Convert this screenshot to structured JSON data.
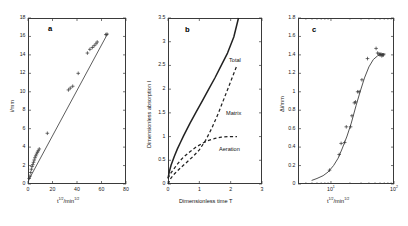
{
  "figure": {
    "panels": [
      {
        "letter": "a",
        "xlabel_html": "t<sup>1/2</sup>/min<sup>1/2</sup>",
        "ylabel": "i/mm",
        "xticks": [
          "0",
          "20",
          "40",
          "60",
          "80"
        ],
        "yticks": [
          "0",
          "2",
          "4",
          "6",
          "8",
          "10",
          "12",
          "14",
          "16",
          "18"
        ]
      },
      {
        "letter": "b",
        "xlabel": "Dimensionless time   T",
        "ylabel": "Dimensionless absorption  I",
        "xticks": [
          "0",
          "1",
          "2",
          "3"
        ],
        "yticks": [
          "0",
          "0.5",
          "1",
          "1.5",
          "2",
          "2.5",
          "3",
          "3.5"
        ],
        "curve_labels": [
          "Total",
          "Matrix",
          "Aeration"
        ]
      },
      {
        "letter": "c",
        "xlabel_html": "t<sup>1/2</sup>/min<sup>1/2</sup>",
        "ylabel": "Δi/mm",
        "xticks": [
          "10<sup>1</sup>",
          "10<sup>2</sup>"
        ],
        "yticks": [
          "0",
          "0.2",
          "0.4",
          "0.6",
          "0.8",
          "1",
          "1.2",
          "1.4",
          "1.6",
          "1.8"
        ]
      }
    ]
  },
  "chart_data": [
    {
      "type": "scatter",
      "panel": "a",
      "title": "a",
      "xlabel": "t^1/2 / min^1/2",
      "ylabel": "i / mm",
      "xlim": [
        0,
        80
      ],
      "ylim": [
        0,
        18
      ],
      "xticks": [
        0,
        20,
        40,
        60,
        80
      ],
      "yticks": [
        0,
        2,
        4,
        6,
        8,
        10,
        12,
        14,
        16,
        18
      ],
      "grid": false,
      "legend": "none",
      "marker": "plus",
      "series": [
        {
          "name": "cumulative absorption",
          "x": [
            1.0,
            1.6,
            2.2,
            2.8,
            3.3,
            3.9,
            4.5,
            5.1,
            5.7,
            6.3,
            7.0,
            7.7,
            8.4,
            9.2,
            15.8,
            33.0,
            34.5,
            36.5,
            41.0,
            48.5,
            50.5,
            52.5,
            54.0,
            55.5,
            56.5,
            63.5,
            64.5
          ],
          "y": [
            0.6,
            0.85,
            1.25,
            1.6,
            1.9,
            2.1,
            2.35,
            2.6,
            2.85,
            3.05,
            3.25,
            3.45,
            3.6,
            3.8,
            5.5,
            10.2,
            10.4,
            10.6,
            12.0,
            14.2,
            14.6,
            14.8,
            15.0,
            15.2,
            15.4,
            16.2,
            16.25
          ]
        }
      ],
      "fit_line": {
        "name": "linear fit",
        "x": [
          0.8,
          65.0
        ],
        "y": [
          0.5,
          16.3
        ],
        "style": "solid"
      }
    },
    {
      "type": "line",
      "panel": "b",
      "title": "b",
      "xlabel": "Dimensionless time   T",
      "ylabel": "Dimensionless absorption  I",
      "xlim": [
        0,
        3
      ],
      "ylim": [
        0,
        3.5
      ],
      "xticks": [
        0,
        1,
        2,
        3
      ],
      "yticks": [
        0,
        0.5,
        1,
        1.5,
        2,
        2.5,
        3,
        3.5
      ],
      "grid": false,
      "legend": "inline-annotations",
      "series": [
        {
          "name": "Total",
          "style": "solid",
          "x": [
            0.0,
            0.05,
            0.1,
            0.2,
            0.3,
            0.4,
            0.5,
            0.7,
            0.9,
            1.1,
            1.3,
            1.5,
            1.7,
            1.9,
            2.1,
            2.25
          ],
          "y": [
            0.12,
            0.28,
            0.4,
            0.58,
            0.74,
            0.88,
            1.02,
            1.28,
            1.52,
            1.76,
            2.0,
            2.24,
            2.5,
            2.76,
            3.1,
            3.5
          ]
        },
        {
          "name": "Matrix",
          "style": "dashed",
          "x": [
            0.0,
            0.1,
            0.2,
            0.4,
            0.6,
            0.8,
            1.0,
            1.2,
            1.4,
            1.6,
            1.8,
            2.0,
            2.2
          ],
          "y": [
            0.0,
            0.13,
            0.21,
            0.34,
            0.46,
            0.58,
            0.72,
            0.92,
            1.18,
            1.48,
            1.82,
            2.16,
            2.5
          ]
        },
        {
          "name": "Aeration",
          "style": "dashed",
          "x": [
            0.0,
            0.1,
            0.2,
            0.3,
            0.4,
            0.5,
            0.7,
            0.9,
            1.1,
            1.3,
            1.5,
            1.7,
            1.9,
            2.1,
            2.2
          ],
          "y": [
            0.12,
            0.24,
            0.33,
            0.42,
            0.5,
            0.57,
            0.68,
            0.78,
            0.86,
            0.92,
            0.96,
            0.99,
            1.0,
            1.0,
            1.0
          ]
        }
      ]
    },
    {
      "type": "scatter",
      "panel": "c",
      "title": "c",
      "xlabel": "t^1/2 / min^1/2",
      "ylabel": "Δi / mm",
      "xscale": "log",
      "xlim": [
        3.0,
        100.0
      ],
      "ylim": [
        0,
        1.8
      ],
      "xticks": [
        10,
        100
      ],
      "yticks": [
        0,
        0.2,
        0.4,
        0.6,
        0.8,
        1.0,
        1.2,
        1.4,
        1.6,
        1.8
      ],
      "grid": false,
      "legend": "none",
      "marker": "plus",
      "series": [
        {
          "name": "aeration component",
          "x": [
            9.5,
            13.5,
            14.5,
            16.5,
            17.5,
            20.5,
            21.5,
            23.5,
            24.5,
            26.5,
            28.0,
            31.0,
            38.0,
            52.0,
            55.0,
            58.0,
            60.0,
            62.0,
            64.0,
            66.0,
            68.0
          ],
          "y": [
            0.15,
            0.32,
            0.44,
            0.45,
            0.62,
            0.62,
            0.74,
            0.88,
            0.89,
            1.0,
            1.0,
            1.13,
            1.36,
            1.47,
            1.42,
            1.41,
            1.4,
            1.41,
            1.39,
            1.4,
            1.4
          ]
        }
      ],
      "fit_curve": {
        "name": "model curve",
        "style": "solid",
        "x": [
          5.0,
          6.0,
          7.5,
          9.0,
          11.0,
          13.0,
          15.0,
          18.0,
          21.0,
          25.0,
          29.0,
          34.0,
          40.0,
          47.0,
          55.0,
          64.0,
          72.0
        ],
        "y": [
          0.04,
          0.06,
          0.09,
          0.13,
          0.2,
          0.28,
          0.38,
          0.52,
          0.66,
          0.85,
          1.0,
          1.15,
          1.27,
          1.35,
          1.39,
          1.41,
          1.41
        ]
      }
    }
  ]
}
